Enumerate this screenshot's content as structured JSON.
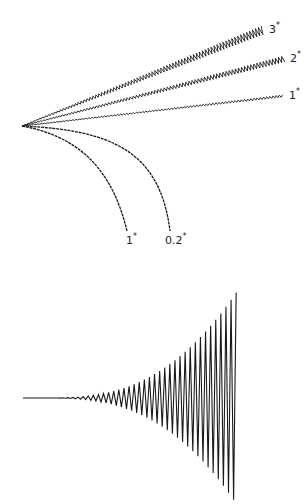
{
  "top_figure": {
    "apex": [
      22,
      126
    ],
    "color": "#1a1a1a",
    "rays": [
      {
        "label": "3",
        "end": [
          263,
          30
        ],
        "label_pos": [
          269,
          33
        ],
        "amp_start": 0.3,
        "amp_end": 4.2,
        "period": 3.2
      },
      {
        "label": "2",
        "end": [
          284,
          59
        ],
        "label_pos": [
          290,
          62
        ],
        "amp_start": 0.3,
        "amp_end": 3.0,
        "period": 3.2
      },
      {
        "label": "1",
        "end": [
          283,
          96
        ],
        "label_pos": [
          289,
          99
        ],
        "amp_start": 0.2,
        "amp_end": 1.2,
        "period": 3.2
      }
    ],
    "curves": [
      {
        "label": "1",
        "end": [
          127,
          231
        ],
        "ctrl1": [
          70,
          135
        ],
        "ctrl2": [
          110,
          160
        ],
        "label_pos": [
          126,
          244
        ]
      },
      {
        "label": "0.2",
        "end": [
          170,
          231
        ],
        "ctrl1": [
          110,
          130
        ],
        "ctrl2": [
          160,
          150
        ],
        "label_pos": [
          165,
          244
        ]
      }
    ]
  },
  "bottom_figure": {
    "start_x": 23,
    "flat_until_x": 50,
    "end_x": 238,
    "baseline_y": 398,
    "max_amp": 107,
    "period": 5.1,
    "color": "#1a1a1a"
  }
}
